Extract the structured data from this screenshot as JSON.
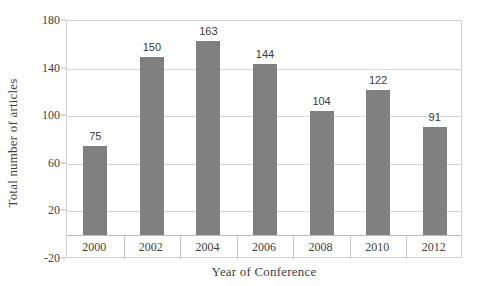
{
  "chart_data": {
    "type": "bar",
    "title": "",
    "subtitle": "",
    "categories": [
      "2000",
      "2002",
      "2004",
      "2006",
      "2008",
      "2010",
      "2012"
    ],
    "values": [
      75,
      150,
      163,
      144,
      104,
      122,
      91
    ],
    "data_labels": [
      "75",
      "150",
      "163",
      "144",
      "104",
      "122",
      "91"
    ],
    "xlabel": "Year of Conference",
    "ylabel": "Total number of articles",
    "ylim": [
      -20,
      180
    ],
    "yticks": [
      180,
      140,
      100,
      60,
      20,
      -20
    ],
    "ytick_labels": [
      "180",
      "140",
      "100",
      "60",
      "20",
      "-20"
    ],
    "grid": true,
    "legend": false,
    "legend_position": "none",
    "bar_color": "#808080",
    "grid_color": "#d7d7d7",
    "plot_border_color": "#d3d3d3",
    "background_color": "#ffffff",
    "text_color": "#3f3f3f"
  }
}
